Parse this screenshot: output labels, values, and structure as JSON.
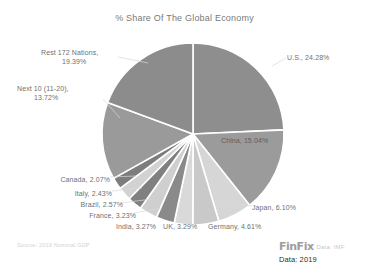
{
  "chart_data": {
    "type": "pie",
    "title": "% Share Of The Global Economy",
    "categories": [
      "U.S.",
      "China",
      "Japan",
      "Germany",
      "UK",
      "India",
      "France",
      "Brazil",
      "Italy",
      "Canada",
      "Next 10 (11-20)",
      "Rest 172 Nations"
    ],
    "values": [
      24.28,
      15.04,
      6.1,
      4.61,
      3.29,
      3.27,
      3.23,
      2.57,
      2.43,
      2.07,
      13.72,
      19.39
    ],
    "labels": [
      "U.S., 24.28%",
      "China, 15.04%",
      "Japan, 6.10%",
      "Germany, 4.61%",
      "UK, 3.29%",
      "India, 3.27%",
      "France, 3.23%",
      "Brazil, 2.57%",
      "Italy, 2.43%",
      "Canada, 2.07%",
      "Next 10 (11-20), 13.72%",
      "Rest 172 Nations, 19.39%"
    ],
    "colors": [
      "#8e8e8e",
      "#9b9b9b",
      "#d6d6d6",
      "#c9c9c9",
      "#d9d9d9",
      "#8a8a8a",
      "#cfcfcf",
      "#808080",
      "#d2d2d2",
      "#7d7d7d",
      "#9a9a9a",
      "#8c8c8c"
    ],
    "slice_gap_color": "#ffffff",
    "legend": "none",
    "grid": false,
    "start_angle_deg": 0,
    "direction": "clockwise",
    "units": "percent"
  },
  "labels_layout": [
    {
      "key": "us",
      "text": "U.S., 24.28%",
      "x": 287,
      "y": 57,
      "align": "left"
    },
    {
      "key": "china",
      "text": "China, 15.04%",
      "x": 221,
      "y": 140,
      "align": "left"
    },
    {
      "key": "japan",
      "text": "Japan, 6.10%",
      "x": 252,
      "y": 208,
      "align": "left"
    },
    {
      "key": "germany",
      "text": "Germany, 4.61%",
      "x": 208,
      "y": 226,
      "align": "left"
    },
    {
      "key": "uk",
      "text": "UK, 3.29%",
      "x": 163,
      "y": 226,
      "align": "left"
    },
    {
      "key": "india",
      "text": "India, 3.27%",
      "x": 116,
      "y": 226,
      "align": "left"
    },
    {
      "key": "france",
      "text": "France, 3.23%",
      "x": 128,
      "y": 215,
      "align": "right"
    },
    {
      "key": "brazil",
      "text": "Brazil, 2.57%",
      "x": 115,
      "y": 205,
      "align": "right"
    },
    {
      "key": "italy",
      "text": "Italy, 2.43%",
      "x": 104,
      "y": 193,
      "align": "right"
    },
    {
      "key": "canada",
      "text": "Canada, 2.07%",
      "x": 104,
      "y": 179,
      "align": "right"
    },
    {
      "key": "next10",
      "text": "Next 10 (11-20),",
      "x": 17,
      "y": 88,
      "align": "left"
    },
    {
      "key": "next10b",
      "text": "13.72%",
      "x": 34,
      "y": 97,
      "align": "left"
    },
    {
      "key": "rest",
      "text": "Rest 172 Nations,",
      "x": 41,
      "y": 52,
      "align": "left"
    },
    {
      "key": "restb",
      "text": "19.39%",
      "x": 62,
      "y": 61,
      "align": "left"
    }
  ],
  "footer": {
    "source_note": "Source: 2019 Nominal GDP",
    "brand": "FinFix",
    "data_source": "Data: IMF",
    "data_year": "Data: 2019"
  }
}
